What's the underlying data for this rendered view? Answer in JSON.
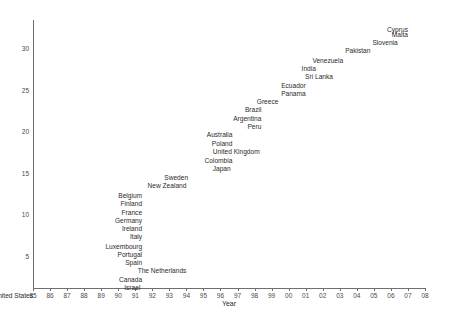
{
  "chart_data": {
    "type": "scatter",
    "title": "",
    "xlabel": "Year",
    "ylabel": "",
    "grid": false,
    "legend": "none",
    "marker_style": "text-label-only",
    "xtick_labels": [
      "85",
      "86",
      "87",
      "88",
      "89",
      "90",
      "91",
      "92",
      "93",
      "94",
      "95",
      "96",
      "97",
      "98",
      "99",
      "00",
      "01",
      "02",
      "03",
      "04",
      "05",
      "06",
      "07",
      "08"
    ],
    "xlim": [
      85,
      108
    ],
    "ytick_labels": [
      "5",
      "10",
      "15",
      "20",
      "25",
      "30"
    ],
    "yticks": [
      5,
      10,
      15,
      20,
      25,
      30
    ],
    "ylim": [
      0,
      32.5
    ],
    "points": [
      {
        "label": "United States",
        "x": 85.0,
        "y": 0.2
      },
      {
        "label": "Israel",
        "x": 91.3,
        "y": 1.2
      },
      {
        "label": "Canada",
        "x": 91.4,
        "y": 2.2
      },
      {
        "label": "The Netherlands",
        "x": 94.0,
        "y": 3.2
      },
      {
        "label": "Spain",
        "x": 91.4,
        "y": 4.2
      },
      {
        "label": "Portugal",
        "x": 91.4,
        "y": 5.2
      },
      {
        "label": "Luxembourg",
        "x": 91.4,
        "y": 6.2
      },
      {
        "label": "Italy",
        "x": 91.4,
        "y": 7.3
      },
      {
        "label": "Ireland",
        "x": 91.4,
        "y": 8.3
      },
      {
        "label": "Germany",
        "x": 91.4,
        "y": 9.3
      },
      {
        "label": "France",
        "x": 91.4,
        "y": 10.3
      },
      {
        "label": "Finland",
        "x": 91.4,
        "y": 11.3
      },
      {
        "label": "Belgium",
        "x": 91.4,
        "y": 12.3
      },
      {
        "label": "New Zealand",
        "x": 94.0,
        "y": 13.5
      },
      {
        "label": "Sweden",
        "x": 94.1,
        "y": 14.5
      },
      {
        "label": "Japan",
        "x": 96.6,
        "y": 15.5
      },
      {
        "label": "Colombia",
        "x": 96.7,
        "y": 16.5
      },
      {
        "label": "United Kingdom",
        "x": 98.3,
        "y": 17.6
      },
      {
        "label": "Poland",
        "x": 96.7,
        "y": 18.6
      },
      {
        "label": "Australia",
        "x": 96.7,
        "y": 19.6
      },
      {
        "label": "Peru",
        "x": 98.4,
        "y": 20.6
      },
      {
        "label": "Argentina",
        "x": 98.4,
        "y": 21.6
      },
      {
        "label": "Brazil",
        "x": 98.4,
        "y": 22.6
      },
      {
        "label": "Greece",
        "x": 99.4,
        "y": 23.6
      },
      {
        "label": "Panama",
        "x": 101.0,
        "y": 24.6
      },
      {
        "label": "Ecuador",
        "x": 101.0,
        "y": 25.6
      },
      {
        "label": "Sri Lanka",
        "x": 102.6,
        "y": 26.6
      },
      {
        "label": "India",
        "x": 101.6,
        "y": 27.6
      },
      {
        "label": "Venezuela",
        "x": 103.2,
        "y": 28.6
      },
      {
        "label": "Pakistan",
        "x": 104.8,
        "y": 29.7
      },
      {
        "label": "Slovenia",
        "x": 106.4,
        "y": 30.7
      },
      {
        "label": "Malta",
        "x": 107.0,
        "y": 31.7
      },
      {
        "label": "Cyprus",
        "x": 107.0,
        "y": 32.3
      }
    ]
  },
  "colors": {
    "axis": "#6f6f6f",
    "tick_text": "#4a4a4a",
    "label_text": "#2b2b2b",
    "background": "#ffffff"
  }
}
